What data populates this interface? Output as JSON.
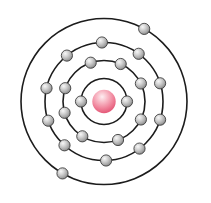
{
  "diagram": {
    "type": "bohr-atom-model",
    "canvas": {
      "width": 211,
      "height": 203,
      "background": "#ffffff"
    },
    "center": {
      "x": 104,
      "y": 101.5
    },
    "orbit": {
      "stroke_color": "#1c1c1c",
      "stroke_width": 1.6
    },
    "nucleus": {
      "radius": 11.7,
      "highlight_color": "#fdeef1",
      "light_color": "#f8bcc8",
      "mid_color": "#f0849b",
      "edge_color": "#e14f70"
    },
    "electron_style": {
      "radius": 5.6,
      "highlight_color": "#f7f7f7",
      "light_color": "#d2d2d2",
      "mid_color": "#a6a6a6",
      "edge_color": "#6b6b6b",
      "outline_color": "#3f3f3f",
      "outline_width": 0.9
    },
    "shells": [
      {
        "name": "shell-1",
        "radius": 23,
        "electron_count": 2,
        "angles_deg": [
          0,
          180
        ]
      },
      {
        "name": "shell-2",
        "radius": 41,
        "electron_count": 8,
        "angles_deg": [
          -109,
          -66,
          -26,
          26,
          70,
          122,
          164,
          -161
        ]
      },
      {
        "name": "shell-3",
        "radius": 59,
        "electron_count": 10,
        "angles_deg": [
          -129,
          -92,
          -54,
          -18,
          18,
          53,
          88,
          132,
          161,
          193
        ]
      },
      {
        "name": "shell-4",
        "radius": 83,
        "electron_count": 2,
        "angles_deg": [
          -61,
          120
        ]
      }
    ],
    "electron_configuration": "2-8-10-2",
    "total_electrons": 22
  }
}
